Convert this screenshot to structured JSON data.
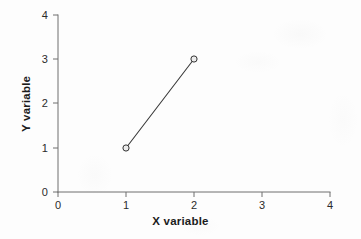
{
  "chart_data": {
    "type": "line",
    "title": "",
    "subtitle": "",
    "xlabel": "X variable",
    "ylabel": "Y variable",
    "x": [
      1,
      2
    ],
    "values": [
      1,
      3
    ],
    "series": [
      {
        "name": "",
        "x": [
          1,
          2
        ],
        "values": [
          1,
          3
        ],
        "marker": "open-circle",
        "line_style": "solid",
        "color": "#3a3a3a"
      }
    ],
    "xlim": [
      0,
      4
    ],
    "ylim": [
      0,
      4
    ],
    "xticks": [
      0,
      1,
      2,
      3,
      4
    ],
    "yticks": [
      0,
      1,
      2,
      3,
      4
    ],
    "xtick_labels": [
      "0",
      "1",
      "2",
      "3",
      "4"
    ],
    "ytick_labels": [
      "0",
      "1",
      "2",
      "3",
      "4"
    ],
    "grid": false,
    "legend": false,
    "legend_position": "none",
    "annotations": [],
    "axis_style": "left-and-bottom-spines-only",
    "tick_direction": "out"
  },
  "figure": {
    "background_color": "#fdfdfd",
    "axis_color": "#6e6e6e",
    "text_color": "#2b2b2b",
    "title_color": "#1c1c1c",
    "data_line_color": "#3a3a3a",
    "marker_face_color": "#e8e8e8",
    "marker_edge_color": "#333333"
  },
  "axes": {
    "x_title": "X variable",
    "y_title": "Y variable"
  }
}
